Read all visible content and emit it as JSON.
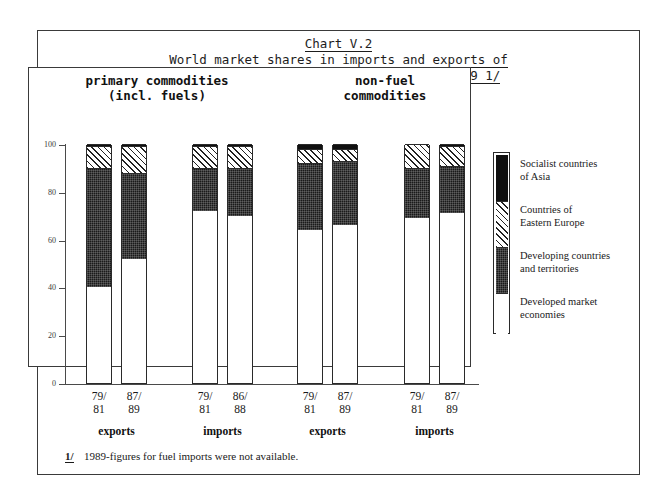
{
  "title": {
    "line1": "Chart V.2",
    "line2": "World market shares in imports and exports of",
    "line3": "primary commodities, 1979/81 and 1987/89 1/"
  },
  "group_headers": {
    "primary": "primary commodities\n(incl. fuels)",
    "nonfuel": "non-fuel\ncommodities"
  },
  "axis": {
    "y_ticks": [
      "100",
      "80",
      "60",
      "40",
      "20",
      "0"
    ],
    "y_min": 0,
    "y_max": 100
  },
  "groups": [
    {
      "label": "exports",
      "bars": [
        {
          "period_top": "79/",
          "period_bottom": "81"
        },
        {
          "period_top": "87/",
          "period_bottom": "89"
        }
      ]
    },
    {
      "label": "imports",
      "bars": [
        {
          "period_top": "79/",
          "period_bottom": "81"
        },
        {
          "period_top": "86/",
          "period_bottom": "88"
        }
      ]
    },
    {
      "label": "exports",
      "bars": [
        {
          "period_top": "79/",
          "period_bottom": "81"
        },
        {
          "period_top": "87/",
          "period_bottom": "89"
        }
      ]
    },
    {
      "label": "imports",
      "bars": [
        {
          "period_top": "79/",
          "period_bottom": "81"
        },
        {
          "period_top": "87/",
          "period_bottom": "89"
        }
      ]
    }
  ],
  "legend": {
    "items": [
      {
        "key": "asia",
        "label": "Socialist countries\nof Asia",
        "swatch": "solid-black"
      },
      {
        "key": "eeurope",
        "label": "Countries of\nEastern Europe",
        "swatch": "diagonal-hatch"
      },
      {
        "key": "developing",
        "label": "Developing countries\nand territories",
        "swatch": "dotted-black"
      },
      {
        "key": "developed",
        "label": "Developed market\neconomies",
        "swatch": "white"
      }
    ]
  },
  "footnote": {
    "marker": "1/",
    "text": "1989-figures for fuel imports were not available."
  },
  "colors": {
    "developed": "#ffffff",
    "developing": "#1a1a1a",
    "eastern_europe": "#ffffff",
    "socialist_asia": "#101010",
    "frame": "#3a3a3a",
    "axis": "#4a4a4a"
  },
  "chart_data": {
    "type": "bar",
    "stacked": true,
    "title": "World market shares in imports and exports of primary commodities, 1979/81 and 1987/89",
    "xlabel": "",
    "ylabel": "",
    "ylim": [
      0,
      100
    ],
    "yticks": [
      0,
      20,
      40,
      60,
      80,
      100
    ],
    "grid": false,
    "legend_position": "right",
    "categories": [
      "primary commodities (incl. fuels) / exports / 79/81",
      "primary commodities (incl. fuels) / exports / 87/89",
      "primary commodities (incl. fuels) / imports / 79/81",
      "primary commodities (incl. fuels) / imports / 86/88",
      "non-fuel commodities / exports / 79/81",
      "non-fuel commodities / exports / 87/89",
      "non-fuel commodities / imports / 79/81",
      "non-fuel commodities / imports / 87/89"
    ],
    "series": [
      {
        "name": "Developed market economies",
        "values": [
          40,
          52,
          72,
          70,
          64,
          66,
          69,
          71
        ]
      },
      {
        "name": "Developing countries and territories",
        "values": [
          50,
          36,
          18,
          20,
          28,
          27,
          21,
          20
        ]
      },
      {
        "name": "Countries of Eastern Europe",
        "values": [
          9,
          11,
          9,
          9,
          6,
          5,
          10,
          8
        ]
      },
      {
        "name": "Socialist countries of Asia",
        "values": [
          1,
          1,
          1,
          1,
          2,
          2,
          0,
          1
        ]
      }
    ],
    "annotations": [
      "1/ 1989-figures for fuel imports were not available."
    ]
  }
}
